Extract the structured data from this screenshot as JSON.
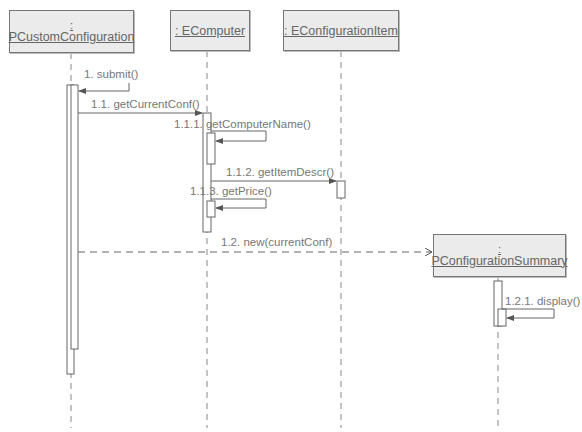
{
  "diagram": {
    "type": "sequence",
    "lifelines": [
      {
        "id": "pcc",
        "colon": ":",
        "name": "PCustomConfiguration",
        "two_line": true
      },
      {
        "id": "ecomp",
        "name": ": EComputer",
        "two_line": false
      },
      {
        "id": "eitem",
        "name": ": EConfigurationItem",
        "two_line": false
      },
      {
        "id": "psum",
        "colon": ":",
        "name": "PConfigurationSummary",
        "two_line": true
      }
    ],
    "messages": [
      {
        "seq": "1",
        "label": "1. submit()",
        "from": "external",
        "to": "PCustomConfiguration",
        "kind": "self"
      },
      {
        "seq": "1.1",
        "label": "1.1. getCurrentConf()",
        "from": "PCustomConfiguration",
        "to": "EComputer",
        "kind": "sync"
      },
      {
        "seq": "1.1.1",
        "label": "1.1.1. getComputerName()",
        "from": "EComputer",
        "to": "EComputer",
        "kind": "self"
      },
      {
        "seq": "1.1.2",
        "label": "1.1.2. getItemDescr()",
        "from": "EComputer",
        "to": "EConfigurationItem",
        "kind": "sync"
      },
      {
        "seq": "1.1.3",
        "label": "1.1.3. getPrice()",
        "from": "EComputer",
        "to": "EComputer",
        "kind": "self"
      },
      {
        "seq": "1.2",
        "label": "1.2. new(currentConf)",
        "from": "PCustomConfiguration",
        "to": "PConfigurationSummary",
        "kind": "create"
      },
      {
        "seq": "1.2.1",
        "label": "1.2.1. display()",
        "from": "PConfigurationSummary",
        "to": "PConfigurationSummary",
        "kind": "self"
      }
    ],
    "colors": {
      "box_fill": "#ebebeb",
      "line": "#777777",
      "text": "#666666"
    }
  }
}
